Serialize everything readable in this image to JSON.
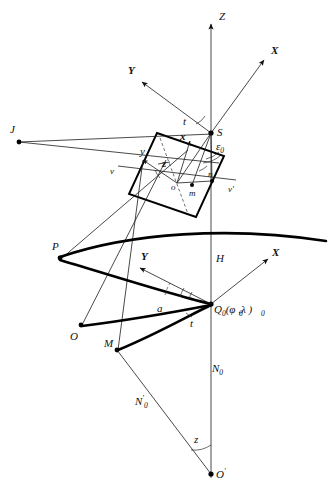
{
  "figure": {
    "background_color": "#ffffff",
    "ink_color": "#111111",
    "width": 333,
    "height": 490
  },
  "labels": {
    "axis_Z": "Z",
    "axis_X_upper": "X",
    "axis_Y_upper": "Y",
    "axis_X_lower": "X",
    "axis_Y_lower": "Y",
    "point_J": "J",
    "point_S": "S",
    "point_o": "o",
    "point_m": "m",
    "point_n": "n",
    "point_v_left": "v",
    "point_v_right": "v'",
    "angle_t_upper": "t",
    "angle_epsilon_0": "ε",
    "angle_epsilon_0_sub": "0",
    "photo_x": "x",
    "photo_y": "y",
    "photo_z": "z",
    "point_P": "P",
    "point_O": "O",
    "point_M": "M",
    "point_Q0_main": "Q",
    "point_Q0_sub": "0",
    "point_Q0_args": "(φ ,λ )",
    "point_Q0_full": "Q₀(φ₀,λ₀)",
    "segment_H": "H",
    "angle_a": "a",
    "angle_t_lower": "t",
    "segment_N0": "N",
    "segment_N0_sub": "0",
    "segment_N0_prime": "N",
    "segment_N0_prime_sub": "0",
    "segment_N0_prime_mark": "'",
    "angle_z": "z",
    "point_O_prime": "O",
    "point_O_prime_mark": "'"
  },
  "geometry": {
    "z_axis": {
      "x": 211,
      "y_top": 22,
      "y_bottom": 478
    },
    "point_S": {
      "x": 211,
      "y": 133
    },
    "point_J": {
      "x": 19,
      "y": 142
    },
    "point_o": {
      "x": 177,
      "y": 183
    },
    "point_m": {
      "x": 192,
      "y": 185
    },
    "point_n": {
      "x": 212,
      "y": 181
    },
    "point_P": {
      "x": 60,
      "y": 257
    },
    "point_O": {
      "x": 81,
      "y": 325
    },
    "point_M": {
      "x": 117,
      "y": 350
    },
    "point_Q0": {
      "x": 211,
      "y": 304
    },
    "point_O_prime": {
      "x": 211,
      "y": 474
    }
  },
  "accent_colors": {
    "line": "#111111",
    "thick_curve": "#000000",
    "background": "#ffffff"
  }
}
